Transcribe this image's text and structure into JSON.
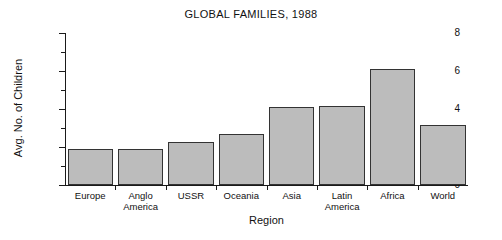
{
  "chart_data": {
    "type": "bar",
    "title": "GLOBAL FAMILIES, 1988",
    "xlabel": "Region",
    "ylabel": "Avg. No. of Children",
    "categories": [
      "Europe",
      "Anglo America",
      "USSR",
      "Oceania",
      "Asia",
      "Latin America",
      "Africa",
      "World"
    ],
    "values": [
      1.9,
      1.9,
      2.25,
      2.7,
      4.1,
      4.15,
      6.1,
      3.15
    ],
    "ylim": [
      0,
      8
    ],
    "ytick_labels": [
      "0",
      "2",
      "4",
      "6",
      "8"
    ],
    "ytick_values": [
      0,
      2,
      4,
      6,
      8
    ],
    "yminor_values": [
      1,
      3,
      5,
      7
    ],
    "grid": false,
    "legend": "none",
    "bar_color": "#bcbcbc",
    "bar_edge_color": "#333333",
    "axis_color": "#1a1a1a",
    "background": "#ffffff"
  }
}
